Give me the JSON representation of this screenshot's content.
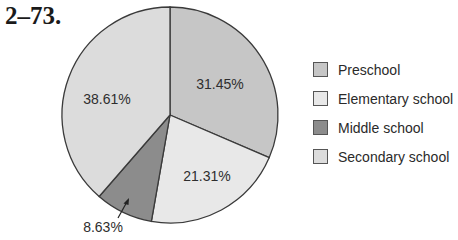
{
  "figure_label": "2–73.",
  "chart_data": {
    "type": "pie",
    "title": "",
    "start_angle_deg": 0,
    "direction": "clockwise",
    "slices": [
      {
        "name": "Preschool",
        "value": 31.45,
        "label": "31.45%",
        "color": "#c6c6c6"
      },
      {
        "name": "Elementary school",
        "value": 21.31,
        "label": "21.31%",
        "color": "#e8e8e8"
      },
      {
        "name": "Middle school",
        "value": 8.63,
        "label": "8.63%",
        "color": "#8c8c8c"
      },
      {
        "name": "Secondary school",
        "value": 38.61,
        "label": "38.61%",
        "color": "#dcdcdc"
      }
    ],
    "legend_position": "right"
  },
  "legend": {
    "items": [
      {
        "label": "Preschool",
        "color": "#c6c6c6"
      },
      {
        "label": "Elementary school",
        "color": "#e8e8e8"
      },
      {
        "label": "Middle school",
        "color": "#8c8c8c"
      },
      {
        "label": "Secondary school",
        "color": "#dcdcdc"
      }
    ]
  }
}
